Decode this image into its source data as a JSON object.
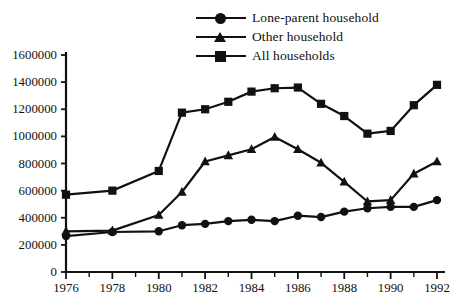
{
  "chart_data": {
    "type": "line",
    "title": "",
    "subtitle": "",
    "xlabel": "",
    "ylabel": "",
    "x": [
      1976,
      1977,
      1978,
      1979,
      1980,
      1981,
      1982,
      1983,
      1984,
      1985,
      1986,
      1987,
      1988,
      1989,
      1990,
      1991,
      1992
    ],
    "xlim": [
      1976,
      1992
    ],
    "ylim": [
      0,
      1600000
    ],
    "grid": false,
    "legend_position": "top-center",
    "x_tick_labels": [
      "1976",
      "1978",
      "1980",
      "1982",
      "1984",
      "1986",
      "1988",
      "1990",
      "1992"
    ],
    "x_tick_values": [
      1976,
      1978,
      1980,
      1982,
      1984,
      1986,
      1988,
      1990,
      1992
    ],
    "x_minor_tick_values": [
      1977,
      1979,
      1981,
      1983,
      1985,
      1987,
      1989,
      1991
    ],
    "y_tick_labels": [
      "0",
      "200000",
      "400000",
      "600000",
      "800000",
      "1000000",
      "1200000",
      "1400000",
      "1600000"
    ],
    "y_tick_values": [
      0,
      200000,
      400000,
      600000,
      800000,
      1000000,
      1200000,
      1400000,
      1600000
    ],
    "series": [
      {
        "name": "Lone-parent household",
        "marker": "circle",
        "color": "#111111",
        "x": [
          1976,
          1978,
          1980,
          1981,
          1982,
          1983,
          1984,
          1985,
          1986,
          1987,
          1988,
          1989,
          1990,
          1991,
          1992
        ],
        "values": [
          265000,
          295000,
          300000,
          345000,
          355000,
          375000,
          385000,
          375000,
          415000,
          405000,
          445000,
          470000,
          480000,
          480000,
          530000
        ]
      },
      {
        "name": "Other household",
        "marker": "triangle",
        "color": "#111111",
        "x": [
          1976,
          1978,
          1980,
          1981,
          1982,
          1983,
          1984,
          1985,
          1986,
          1987,
          1988,
          1989,
          1990,
          1991,
          1992
        ],
        "values": [
          300000,
          305000,
          420000,
          590000,
          815000,
          860000,
          905000,
          995000,
          905000,
          805000,
          665000,
          520000,
          530000,
          725000,
          815000
        ]
      },
      {
        "name": "All households",
        "marker": "square",
        "color": "#111111",
        "x": [
          1976,
          1978,
          1980,
          1981,
          1982,
          1983,
          1984,
          1985,
          1986,
          1987,
          1988,
          1989,
          1990,
          1991,
          1992
        ],
        "values": [
          570000,
          600000,
          745000,
          1175000,
          1200000,
          1255000,
          1330000,
          1355000,
          1360000,
          1240000,
          1150000,
          1020000,
          1040000,
          1230000,
          1380000
        ]
      }
    ]
  },
  "legend": {
    "items": [
      {
        "label": "Lone-parent household",
        "marker": "circle"
      },
      {
        "label": "Other household",
        "marker": "triangle"
      },
      {
        "label": "All households",
        "marker": "square"
      }
    ]
  },
  "axes": {
    "y_labels": [
      "1600000",
      "1400000",
      "1200000",
      "1000000",
      "800000",
      "600000",
      "400000",
      "200000",
      "0"
    ],
    "x_labels": [
      "1976",
      "1978",
      "1980",
      "1982",
      "1984",
      "1986",
      "1988",
      "1990",
      "1992"
    ]
  }
}
